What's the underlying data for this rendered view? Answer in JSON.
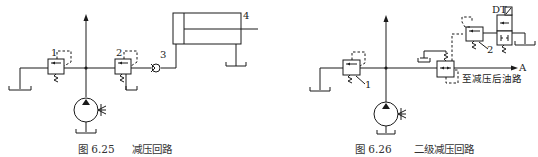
{
  "figures": [
    {
      "id": "fig-6-25",
      "caption_number": "图 6.25",
      "caption_title": "减压回路",
      "component_labels": [
        "1",
        "2",
        "3",
        "4"
      ]
    },
    {
      "id": "fig-6-26",
      "caption_number": "图 6.26",
      "caption_title": "二级减压回路",
      "component_labels": [
        "1",
        "2",
        "DT",
        "A"
      ],
      "note": "至减压后油路"
    }
  ]
}
